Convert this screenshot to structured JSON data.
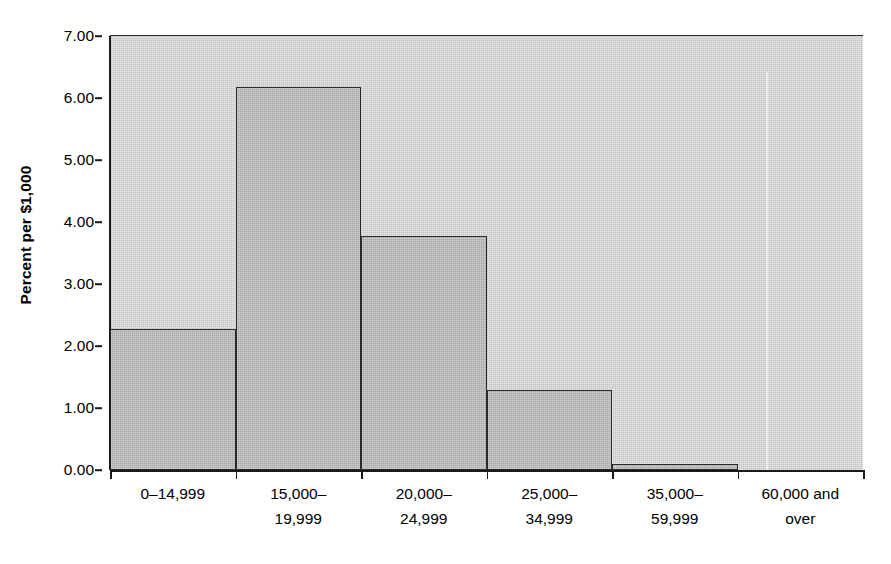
{
  "chart_data": {
    "type": "bar",
    "title": "",
    "subtitle": "",
    "xlabel": "",
    "ylabel": "Percent per $1,000",
    "categories": [
      "0–14,999",
      "15,000–19,999",
      "20,000–24,999",
      "25,000–34,999",
      "35,000–59,999",
      "60,000 and over"
    ],
    "category_lines": [
      [
        "0–14,999",
        ""
      ],
      [
        "15,000–",
        "19,999"
      ],
      [
        "20,000–",
        "24,999"
      ],
      [
        "25,000–",
        "34,999"
      ],
      [
        "35,000–",
        "59,999"
      ],
      [
        "60,000 and",
        "over"
      ]
    ],
    "values": [
      2.27,
      6.18,
      3.78,
      1.29,
      0.1,
      0.0
    ],
    "ylim": [
      0,
      7
    ],
    "ytick_values": [
      0,
      1,
      2,
      3,
      4,
      5,
      6,
      7
    ],
    "ytick_labels": [
      "0.00",
      "1.00",
      "2.00",
      "3.00",
      "4.00",
      "5.00",
      "6.00",
      "7.00"
    ],
    "grid": false,
    "legend": "none",
    "bar_gap": 0,
    "plot_background_color": "#c5c5c5",
    "bar_fill_color": "#a9a9a9",
    "bar_edge_color": "#2b2b2b",
    "axis_color": "#1a1a1a",
    "page_background_color": "#ffffff"
  },
  "caption": {
    "text": ""
  }
}
